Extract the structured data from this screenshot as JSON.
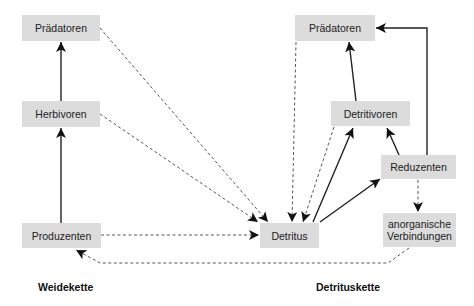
{
  "nodes": {
    "left_predators": "Prädatoren",
    "herbivores": "Herbivoren",
    "producers": "Produzenten",
    "detritus": "Detritus",
    "right_predators": "Prädatoren",
    "detritivores": "Detritivoren",
    "decomposers": "Reduzenten",
    "inorganic_line1": "anorganische",
    "inorganic_line2": "Verbindungen"
  },
  "labels": {
    "grazing_chain": "Weidekette",
    "detritus_chain": "Detrituskette"
  },
  "edges": [
    {
      "from": "Produzenten",
      "to": "Herbivoren",
      "style": "solid"
    },
    {
      "from": "Herbivoren",
      "to": "Prädatoren (links)",
      "style": "solid"
    },
    {
      "from": "Prädatoren (links)",
      "to": "Detritus",
      "style": "dashed"
    },
    {
      "from": "Herbivoren",
      "to": "Detritus",
      "style": "dashed"
    },
    {
      "from": "Produzenten",
      "to": "Detritus",
      "style": "dashed"
    },
    {
      "from": "Prädatoren (rechts)",
      "to": "Detritus",
      "style": "dashed"
    },
    {
      "from": "Detritivoren",
      "to": "Detritus",
      "style": "dashed"
    },
    {
      "from": "Detritus",
      "to": "Detritivoren",
      "style": "solid"
    },
    {
      "from": "Detritus",
      "to": "Reduzenten",
      "style": "solid"
    },
    {
      "from": "Detritivoren",
      "to": "Prädatoren (rechts)",
      "style": "solid"
    },
    {
      "from": "Reduzenten",
      "to": "Detritivoren",
      "style": "solid"
    },
    {
      "from": "Reduzenten",
      "to": "Prädatoren (rechts)",
      "style": "solid"
    },
    {
      "from": "Reduzenten",
      "to": "anorganische Verbindungen",
      "style": "dashed"
    },
    {
      "from": "anorganische Verbindungen",
      "to": "Produzenten",
      "style": "dashed"
    }
  ],
  "colors": {
    "box_fill": "#dcdcdc",
    "line": "#222222"
  }
}
